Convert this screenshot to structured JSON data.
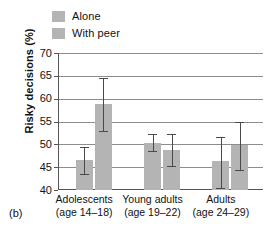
{
  "panel": {
    "label": "(b)"
  },
  "legend": {
    "position": "top-left",
    "items": [
      {
        "label": "Alone",
        "color": "#b4b4b4",
        "icon": "legend-swatch-icon"
      },
      {
        "label": "With peer",
        "color": "#b4b4b4",
        "icon": "legend-swatch-icon"
      }
    ]
  },
  "axes": {
    "ylabel": "Risky decisions (%)",
    "yticks": [
      "70",
      "65",
      "60",
      "55",
      "50",
      "45",
      "40"
    ],
    "xlabel": ""
  },
  "chart_data": {
    "type": "bar",
    "title": "",
    "subtitle": "",
    "xlabel": "",
    "ylabel": "Risky decisions (%)",
    "ylim": [
      40,
      70
    ],
    "ytick_values": [
      40,
      45,
      50,
      55,
      60,
      65,
      70
    ],
    "grid": true,
    "legend_position": "top-left",
    "categories": [
      "Adolescents (age 14–18)",
      "Young adults (age 19–22)",
      "Adults (age 24–29)"
    ],
    "category_lines": [
      {
        "line1": "Adolescents",
        "line2": "(age 14–18)"
      },
      {
        "line1": "Young adults",
        "line2": "(age 19–22)"
      },
      {
        "line1": "Adults",
        "line2": "(age 24–29)"
      }
    ],
    "series": [
      {
        "name": "Alone",
        "color": "#b4b4b4",
        "values": [
          46.5,
          50.2,
          46.3
        ],
        "error_low": [
          43.5,
          48.5,
          40.5
        ],
        "error_high": [
          49.5,
          52.3,
          51.5
        ]
      },
      {
        "name": "With peer",
        "color": "#b4b4b4",
        "values": [
          58.8,
          48.7,
          49.8
        ],
        "error_low": [
          53.0,
          45.3,
          44.3
        ],
        "error_high": [
          64.5,
          52.3,
          55.0
        ]
      }
    ],
    "annotations": []
  },
  "colors": {
    "bar_fill": "#b4b4b4",
    "grid": "#8d8d8d",
    "axis": "#555555",
    "error": "#4a4a4a",
    "background": "#ffffff"
  }
}
